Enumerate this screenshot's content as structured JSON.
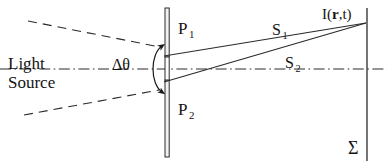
{
  "figure": {
    "width": 387,
    "height": 167,
    "background": "#ffffff",
    "ink_color": "#141414"
  },
  "labels": {
    "light_source_line1": "Light",
    "light_source_line2": "Source",
    "delta_theta": "Δθ",
    "aperture_top": "P",
    "aperture_top_sub": "1",
    "aperture_bottom": "P",
    "aperture_bottom_sub": "2",
    "ray_top": "S",
    "ray_top_sub": "1",
    "ray_bottom": "S",
    "ray_bottom_sub": "2",
    "field_point_prefix": "I(",
    "field_point_vector": "r",
    "field_point_suffix": ",t)",
    "screen": "Σ"
  },
  "geometry": {
    "optical_axis": {
      "x1": 0,
      "y1": 69,
      "x2": 387,
      "y2": 69,
      "style": "dash-dot"
    },
    "source_ray_upper": {
      "x1": 30,
      "y1": 22,
      "x2": 158,
      "y2": 47,
      "style": "dashed"
    },
    "source_ray_lower": {
      "x1": 26,
      "y1": 114,
      "x2": 157,
      "y2": 90,
      "style": "dashed"
    },
    "barrier_upper": {
      "x": 167,
      "y1": 8,
      "y2": 57,
      "style": "solid-double"
    },
    "barrier_lower": {
      "x": 167,
      "y1": 80,
      "y2": 156,
      "style": "solid-double"
    },
    "slit_aperture": {
      "x": 167,
      "y1": 57,
      "y2": 80
    },
    "angle_arc": {
      "cx": 158,
      "cy": 68,
      "ry": 23,
      "bulge": 12,
      "arrows": "both"
    },
    "ray_s1": {
      "x1": 165,
      "y1": 55,
      "x2": 366,
      "y2": 22,
      "style": "solid"
    },
    "ray_s2": {
      "x1": 165,
      "y1": 82,
      "x2": 366,
      "y2": 22,
      "style": "solid"
    },
    "screen_line": {
      "x": 367,
      "y1": 8,
      "y2": 161,
      "style": "solid"
    }
  }
}
